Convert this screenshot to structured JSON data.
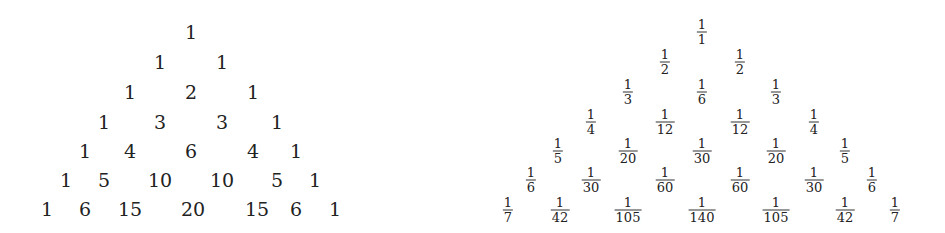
{
  "pascal_triangle": {
    "rows": [
      [
        "1"
      ],
      [
        "1",
        "1"
      ],
      [
        "1",
        "2",
        "1"
      ],
      [
        "1",
        "3",
        "3",
        "1"
      ],
      [
        "1",
        "4",
        "6",
        "4",
        "1"
      ],
      [
        "1",
        "5",
        "10",
        "10",
        "5",
        "1"
      ],
      [
        "1",
        "6",
        "15",
        "20",
        "15",
        "6",
        "1"
      ]
    ]
  },
  "harmonic_triangle": {
    "rows": [
      [
        {
          "n": "1",
          "d": "1"
        }
      ],
      [
        {
          "n": "1",
          "d": "2"
        },
        {
          "n": "1",
          "d": "2"
        }
      ],
      [
        {
          "n": "1",
          "d": "3"
        },
        {
          "n": "1",
          "d": "6"
        },
        {
          "n": "1",
          "d": "3"
        }
      ],
      [
        {
          "n": "1",
          "d": "4"
        },
        {
          "n": "1",
          "d": "12"
        },
        {
          "n": "1",
          "d": "12"
        },
        {
          "n": "1",
          "d": "4"
        }
      ],
      [
        {
          "n": "1",
          "d": "5"
        },
        {
          "n": "1",
          "d": "20"
        },
        {
          "n": "1",
          "d": "30"
        },
        {
          "n": "1",
          "d": "20"
        },
        {
          "n": "1",
          "d": "5"
        }
      ],
      [
        {
          "n": "1",
          "d": "6"
        },
        {
          "n": "1",
          "d": "30"
        },
        {
          "n": "1",
          "d": "60"
        },
        {
          "n": "1",
          "d": "60"
        },
        {
          "n": "1",
          "d": "30"
        },
        {
          "n": "1",
          "d": "6"
        }
      ],
      [
        {
          "n": "1",
          "d": "7"
        },
        {
          "n": "1",
          "d": "42"
        },
        {
          "n": "1",
          "d": "105"
        },
        {
          "n": "1",
          "d": "140"
        },
        {
          "n": "1",
          "d": "105"
        },
        {
          "n": "1",
          "d": "42"
        },
        {
          "n": "1",
          "d": "7"
        }
      ]
    ]
  }
}
